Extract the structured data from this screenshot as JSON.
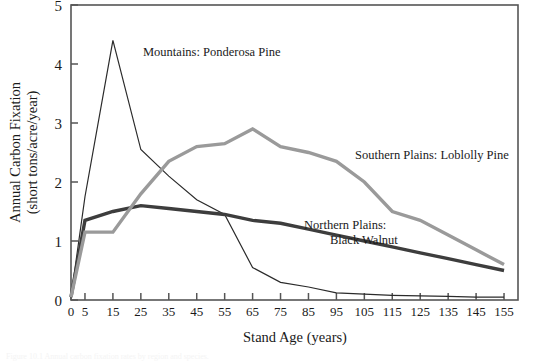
{
  "figure": {
    "frame": {
      "left": 71,
      "right": 518,
      "top": 5,
      "bottom": 300
    },
    "axis_color": "#555555",
    "background": "#ffffff"
  },
  "chart_data": {
    "type": "line",
    "title": "",
    "xlabel": "Stand Age (years)",
    "ylabel": "Annual Carbon Fixation (short tons/acre/year)",
    "ylabel_lines": [
      "Annual Carbon Fixation",
      "(short tons/acre/year)"
    ],
    "xlim": [
      0,
      160
    ],
    "ylim": [
      0,
      5
    ],
    "xticks": [
      0,
      5,
      15,
      25,
      35,
      45,
      55,
      65,
      75,
      85,
      95,
      105,
      115,
      125,
      135,
      145,
      155
    ],
    "xtick_labels": [
      "0",
      "5",
      "15",
      "25",
      "35",
      "45",
      "55",
      "65",
      "75",
      "85",
      "95",
      "105",
      "115",
      "125",
      "135",
      "145",
      "155"
    ],
    "yticks": [
      0,
      1,
      2,
      3,
      4,
      5
    ],
    "ytick_labels": [
      "0",
      "1",
      "2",
      "3",
      "4",
      "5"
    ],
    "grid": false,
    "legend": "inline-annotations",
    "x": [
      0,
      5,
      15,
      25,
      35,
      45,
      55,
      65,
      75,
      85,
      95,
      105,
      115,
      125,
      135,
      145,
      155
    ],
    "series": [
      {
        "name": "Mountains: Ponderosa Pine",
        "color": "#2b2b2b",
        "width": 1.2,
        "values": [
          0.05,
          1.75,
          4.4,
          2.55,
          2.1,
          1.7,
          1.45,
          0.55,
          0.3,
          0.22,
          0.12,
          0.1,
          0.08,
          0.07,
          0.06,
          0.05,
          0.05
        ],
        "label": {
          "text": "Mountains: Ponderosa Pine",
          "x": 143,
          "y": 56,
          "anchor": "start"
        }
      },
      {
        "name": "Northern Plains: Black Walnut",
        "color": "#3d3d3d",
        "width": 3.4,
        "values": [
          0.05,
          1.35,
          1.5,
          1.6,
          1.55,
          1.5,
          1.45,
          1.35,
          1.3,
          1.2,
          1.1,
          1.0,
          0.9,
          0.8,
          0.7,
          0.6,
          0.5
        ],
        "label": {
          "text_lines": [
            "Northern Plains:",
            "Black Walnut"
          ],
          "x": 304,
          "y": 229,
          "anchor": "start"
        }
      },
      {
        "name": "Southern Plains: Loblolly Pine",
        "color": "#9a9a9a",
        "width": 3.4,
        "values": [
          0.05,
          1.15,
          1.15,
          1.8,
          2.35,
          2.6,
          2.65,
          2.9,
          2.6,
          2.5,
          2.35,
          2.0,
          1.5,
          1.35,
          1.1,
          0.85,
          0.6
        ],
        "label": {
          "text": "Southern Plains: Loblolly Pine",
          "x": 355,
          "y": 159,
          "anchor": "start"
        }
      }
    ]
  },
  "caption": {
    "text": "Figure 10.1   Annual carbon fixation rates by region and species."
  }
}
